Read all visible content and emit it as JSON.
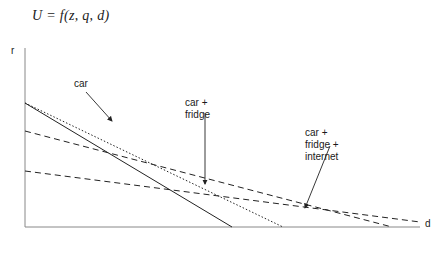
{
  "figure": {
    "equation": "U = f(z, q, d)",
    "axes": {
      "y_label": "r",
      "x_label": "d"
    },
    "annotations": {
      "car": "car",
      "car_fridge": "car +\nfridge",
      "car_fridge_internet": "car +\nfridge +\ninternet"
    },
    "colors": {
      "line": "#222222",
      "axis": "#888888",
      "text": "#1a1a1a"
    }
  },
  "chart_data": {
    "type": "line",
    "title": "U = f(z, q, d)",
    "xlabel": "d",
    "ylabel": "r",
    "grid": false,
    "legend": "annotations",
    "axis_origin": [
      25,
      227
    ],
    "x_axis_end": [
      420,
      227
    ],
    "y_axis_top": [
      25,
      48
    ],
    "xlim": [
      0,
      420
    ],
    "ylim": [
      0,
      180
    ],
    "series": [
      {
        "name": "car",
        "style": "solid",
        "label": "car",
        "points": [
          [
            25,
            103
          ],
          [
            232,
            227
          ]
        ]
      },
      {
        "name": "car-dotted",
        "style": "dotted",
        "label": "car",
        "points": [
          [
            25,
            103
          ],
          [
            283,
            227
          ]
        ]
      },
      {
        "name": "car + fridge",
        "style": "dashed",
        "label": "car +\nfridge",
        "points": [
          [
            25,
            131
          ],
          [
            392,
            227
          ]
        ]
      },
      {
        "name": "car + fridge + internet",
        "style": "dashed",
        "label": "car +\nfridge +\ninternet",
        "points": [
          [
            25,
            171
          ],
          [
            420,
            222
          ]
        ]
      }
    ],
    "arrows": [
      {
        "name": "car",
        "from": [
          86,
          92
        ],
        "to": [
          112,
          121
        ]
      },
      {
        "name": "car + fridge",
        "from": [
          205,
          113
        ],
        "to": [
          205,
          184
        ]
      },
      {
        "name": "car + fridge + internet",
        "from": [
          330,
          146
        ],
        "to": [
          305,
          208
        ]
      }
    ]
  }
}
